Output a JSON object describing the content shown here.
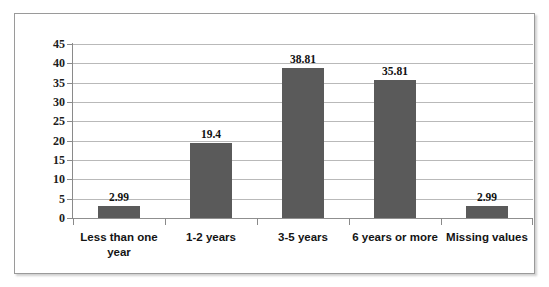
{
  "chart_data": {
    "type": "bar",
    "title": "",
    "subtitle": "",
    "xlabel": "",
    "ylabel": "",
    "categories": [
      "Less than one year",
      "1-2 years",
      "3-5  years",
      "6 years or more",
      "Missing values"
    ],
    "values": [
      2.99,
      19.4,
      38.81,
      35.81,
      2.99
    ],
    "value_labels": [
      "2.99",
      "19.4",
      "38.81",
      "35.81",
      "2.99"
    ],
    "ylim": [
      0,
      45
    ],
    "ytick_step": 5,
    "ytick_labels": [
      "45",
      "40",
      "35",
      "30",
      "25",
      "20",
      "15",
      "10",
      "5",
      "0"
    ],
    "ytick_values": [
      45,
      40,
      35,
      30,
      25,
      20,
      15,
      10,
      5,
      0
    ],
    "grid": true,
    "legend": false,
    "legend_position": "none",
    "series": [
      {
        "name": "",
        "values": [
          2.99,
          19.4,
          38.81,
          35.81,
          2.99
        ],
        "color": "#5a5a5a"
      }
    ],
    "colors": {
      "bar_fill": "#5a5a5a",
      "gridline": "#b9b9b9",
      "axis": "#8a8a8a",
      "plot_background": "#ffffff",
      "frame_border": "#9a9a9a",
      "text": "#1a1a1a"
    }
  }
}
